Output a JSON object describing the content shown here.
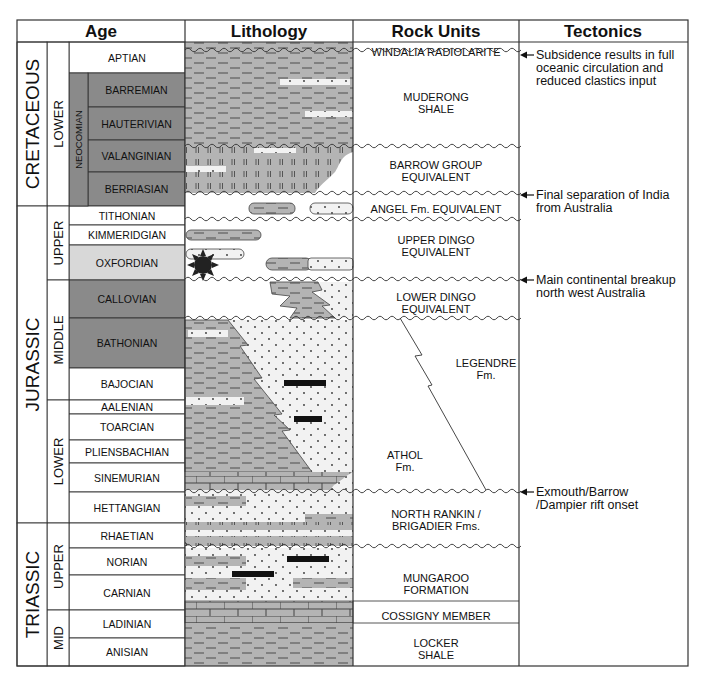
{
  "headers": {
    "age": "Age",
    "lithology": "Lithology",
    "rock_units": "Rock Units",
    "tectonics": "Tectonics"
  },
  "colors": {
    "stage_dark": "#8a8a8a",
    "stage_light": "#d8d8d8",
    "stage_white": "#ffffff",
    "shale": "#b4b4b4",
    "sand": "#f2f2f2",
    "line": "#333333"
  },
  "periods": [
    {
      "label": "CRETACEOUS",
      "top": 42,
      "bottom": 206
    },
    {
      "label": "JURASSIC",
      "top": 206,
      "bottom": 523
    },
    {
      "label": "TRIASSIC",
      "top": 523,
      "bottom": 666
    }
  ],
  "epochs": [
    {
      "label": "LOWER",
      "top": 42,
      "bottom": 206
    },
    {
      "label": "UPPER",
      "top": 206,
      "bottom": 280
    },
    {
      "label": "MIDDLE",
      "top": 280,
      "bottom": 400
    },
    {
      "label": "LOWER",
      "top": 400,
      "bottom": 523
    },
    {
      "label": "UPPER",
      "top": 523,
      "bottom": 610
    },
    {
      "label": "MID",
      "top": 610,
      "bottom": 666
    }
  ],
  "subgroup": {
    "label": "NEOCOMIAN",
    "top": 73,
    "bottom": 206
  },
  "stages": [
    {
      "label": "APTIAN",
      "top": 42,
      "bottom": 73,
      "shade": "white"
    },
    {
      "label": "BARREMIAN",
      "top": 73,
      "bottom": 107,
      "shade": "dark"
    },
    {
      "label": "HAUTERIVIAN",
      "top": 107,
      "bottom": 140,
      "shade": "dark"
    },
    {
      "label": "VALANGINIAN",
      "top": 140,
      "bottom": 172,
      "shade": "dark"
    },
    {
      "label": "BERRIASIAN",
      "top": 172,
      "bottom": 206,
      "shade": "dark"
    },
    {
      "label": "TITHONIAN",
      "top": 206,
      "bottom": 225,
      "shade": "white"
    },
    {
      "label": "KIMMERIDGIAN",
      "top": 225,
      "bottom": 245,
      "shade": "white"
    },
    {
      "label": "OXFORDIAN",
      "top": 245,
      "bottom": 280,
      "shade": "light"
    },
    {
      "label": "CALLOVIAN",
      "top": 280,
      "bottom": 318,
      "shade": "dark"
    },
    {
      "label": "BATHONIAN",
      "top": 318,
      "bottom": 368,
      "shade": "dark"
    },
    {
      "label": "BAJOCIAN",
      "top": 368,
      "bottom": 400,
      "shade": "white"
    },
    {
      "label": "AALENIAN",
      "top": 400,
      "bottom": 414,
      "shade": "white"
    },
    {
      "label": "TOARCIAN",
      "top": 414,
      "bottom": 440,
      "shade": "white"
    },
    {
      "label": "PLIENSBACHIAN",
      "top": 440,
      "bottom": 463,
      "shade": "white"
    },
    {
      "label": "SINEMURIAN",
      "top": 463,
      "bottom": 492,
      "shade": "white"
    },
    {
      "label": "HETTANGIAN",
      "top": 492,
      "bottom": 523,
      "shade": "white"
    },
    {
      "label": "RHAETIAN",
      "top": 523,
      "bottom": 548,
      "shade": "white"
    },
    {
      "label": "NORIAN",
      "top": 548,
      "bottom": 575,
      "shade": "white"
    },
    {
      "label": "CARNIAN",
      "top": 575,
      "bottom": 610,
      "shade": "white"
    },
    {
      "label": "LADINIAN",
      "top": 610,
      "bottom": 638,
      "shade": "white"
    },
    {
      "label": "ANISIAN",
      "top": 638,
      "bottom": 666,
      "shade": "white"
    }
  ],
  "rock_units": [
    {
      "lines": [
        "WINDALIA RADIOLARITE"
      ],
      "y": 52
    },
    {
      "lines": [
        "MUDERONG",
        "SHALE"
      ],
      "y": 97
    },
    {
      "lines": [
        "BARROW GROUP",
        "EQUIVALENT"
      ],
      "y": 165
    },
    {
      "lines": [
        "ANGEL Fm. EQUIVALENT"
      ],
      "y": 209
    },
    {
      "lines": [
        "UPPER DINGO",
        "EQUIVALENT"
      ],
      "y": 240
    },
    {
      "lines": [
        "LOWER DINGO",
        "EQUIVALENT"
      ],
      "y": 297
    },
    {
      "lines": [
        "LEGENDRE",
        "Fm."
      ],
      "y": 363,
      "x": 486
    },
    {
      "lines": [
        "ATHOL",
        "Fm."
      ],
      "y": 455,
      "x": 405
    },
    {
      "lines": [
        "NORTH RANKIN /",
        "BRIGADIER Fms."
      ],
      "y": 514
    },
    {
      "lines": [
        "MUNGAROO",
        "FORMATION"
      ],
      "y": 578
    },
    {
      "lines": [
        "COSSIGNY MEMBER"
      ],
      "y": 616
    },
    {
      "lines": [
        "LOCKER",
        "SHALE"
      ],
      "y": 643
    }
  ],
  "unconformities_y": [
    50,
    146,
    193,
    219,
    279,
    318,
    491,
    546
  ],
  "tectonic_events": [
    {
      "arrow_y": 55,
      "lines": [
        "Subsidence results in full",
        "oceanic circulation and",
        "reduced clastics input"
      ]
    },
    {
      "arrow_y": 195,
      "lines": [
        "Final separation of India",
        "from Australia"
      ]
    },
    {
      "arrow_y": 280,
      "lines": [
        "Main continental breakup",
        "north west Australia"
      ]
    },
    {
      "arrow_y": 492,
      "lines": [
        "Exmouth/Barrow",
        "/Dampier rift onset"
      ]
    }
  ]
}
